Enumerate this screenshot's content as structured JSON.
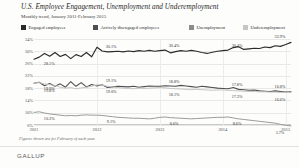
{
  "header": {
    "title": "U.S. Employee Engagement, Unemployment and Underemployment",
    "subtitle": "Monthly trend, January 2011-February 2015"
  },
  "legend": {
    "position": "top",
    "items": [
      {
        "label": "Engaged employees",
        "color": "#2b2b2b",
        "left": 0
      },
      {
        "label": "Actively disengaged employees",
        "color": "#4f4f4f",
        "left": 72
      },
      {
        "label": "Unemployment",
        "color": "#8c8c8c",
        "left": 168
      },
      {
        "label": "Underemployment",
        "color": "#c6c6c6",
        "left": 222
      }
    ]
  },
  "footnote": "Figures shown are for February of each year.",
  "brand": "GALLUP",
  "chart_data": {
    "type": "line",
    "title": "U.S. Employee Engagement, Unemployment and Underemployment",
    "subtitle": "Monthly trend, January 2011-February 2015",
    "xlabel": "",
    "ylabel": "",
    "ylim": [
      6,
      34
    ],
    "yticks": [
      "34%",
      "30%",
      "26%",
      "22%",
      "18%",
      "14%",
      "10%",
      "6%"
    ],
    "ytick_values": [
      34,
      30,
      26,
      22,
      18,
      14,
      10,
      6
    ],
    "xticks": [
      "2011",
      "2012",
      "2013",
      "2014",
      "2015"
    ],
    "grid": true,
    "x_start": "2011-01",
    "x_end": "2015-02",
    "n_points": 50,
    "annotations": [
      {
        "series": "Engaged employees",
        "index": 1,
        "value": 28.1,
        "label": "28.1%"
      },
      {
        "series": "Engaged employees",
        "index": 13,
        "value": 30.1,
        "label": "30.1%"
      },
      {
        "series": "Engaged employees",
        "index": 25,
        "value": 30.4,
        "label": "30.4%"
      },
      {
        "series": "Engaged employees",
        "index": 37,
        "value": 30.4,
        "label": "30.4%"
      },
      {
        "series": "Engaged employees",
        "index": 49,
        "value": 32.9,
        "label": "32.9%"
      },
      {
        "series": "Actively disengaged employees",
        "index": 1,
        "value": 19.9,
        "label": "19.9%"
      },
      {
        "series": "Actively disengaged employees",
        "index": 13,
        "value": 19.1,
        "label": "19.1%"
      },
      {
        "series": "Actively disengaged employees",
        "index": 25,
        "value": 18.8,
        "label": "18.8%"
      },
      {
        "series": "Actively disengaged employees",
        "index": 37,
        "value": 17.8,
        "label": "17.8%"
      },
      {
        "series": "Actively disengaged employees",
        "index": 49,
        "value": 16.8,
        "label": "16.8%"
      },
      {
        "series": "Underemployment",
        "index": 1,
        "value": 19.8,
        "label": "19.8%"
      },
      {
        "series": "Underemployment",
        "index": 13,
        "value": 19.0,
        "label": "19.0%"
      },
      {
        "series": "Underemployment",
        "index": 25,
        "value": 18.1,
        "label": "18.1%"
      },
      {
        "series": "Underemployment",
        "index": 37,
        "value": 17.3,
        "label": "17.3%"
      },
      {
        "series": "Underemployment",
        "index": 49,
        "value": 16.6,
        "label": "16.6%"
      },
      {
        "series": "Unemployment",
        "index": 1,
        "value": 10.3,
        "label": "10.3%"
      },
      {
        "series": "Unemployment",
        "index": 13,
        "value": 9.1,
        "label": "9.1%"
      },
      {
        "series": "Unemployment",
        "index": 25,
        "value": 8.6,
        "label": "8.6%"
      },
      {
        "series": "Unemployment",
        "index": 37,
        "value": 8.6,
        "label": "8.6%"
      },
      {
        "series": "Unemployment",
        "index": 49,
        "value": 5.7,
        "label": "5.7%"
      }
    ],
    "series": [
      {
        "name": "Engaged employees",
        "color": "#2b2b2b",
        "width": 1.15,
        "values": [
          27.4,
          28.1,
          29.3,
          28.4,
          29.6,
          28.3,
          29.0,
          27.6,
          28.9,
          28.3,
          29.6,
          28.2,
          31.3,
          30.1,
          29.8,
          29.9,
          30.0,
          29.8,
          30.1,
          29.9,
          30.2,
          30.0,
          30.3,
          30.0,
          30.2,
          30.4,
          29.5,
          29.9,
          30.2,
          30.0,
          30.3,
          30.0,
          29.6,
          29.3,
          29.7,
          30.0,
          30.2,
          30.4,
          31.2,
          31.5,
          30.6,
          30.8,
          31.0,
          30.9,
          31.4,
          31.2,
          31.8,
          31.6,
          32.2,
          32.9
        ]
      },
      {
        "name": "Actively disengaged employees",
        "color": "#4f4f4f",
        "width": 1.1,
        "values": [
          19.6,
          19.9,
          18.8,
          19.5,
          18.6,
          19.4,
          18.3,
          20.1,
          18.6,
          19.8,
          18.4,
          19.2,
          18.7,
          19.1,
          18.2,
          18.4,
          18.6,
          18.5,
          18.4,
          18.6,
          18.3,
          18.5,
          18.7,
          18.6,
          18.6,
          18.8,
          18.7,
          18.6,
          18.9,
          18.7,
          18.5,
          18.3,
          18.6,
          18.4,
          18.2,
          18.0,
          17.9,
          17.8,
          18.2,
          17.6,
          17.5,
          17.3,
          17.4,
          17.1,
          17.0,
          16.9,
          17.1,
          16.9,
          16.7,
          16.8
        ]
      },
      {
        "name": "Underemployment",
        "color": "#c6c6c6",
        "width": 1.0,
        "values": [
          19.6,
          19.8,
          19.4,
          19.1,
          18.9,
          18.3,
          18.0,
          18.2,
          17.8,
          18.1,
          18.3,
          18.6,
          19.1,
          19.0,
          18.6,
          18.4,
          18.2,
          18.0,
          17.9,
          17.8,
          18.0,
          17.9,
          18.0,
          18.1,
          18.2,
          18.1,
          17.9,
          17.8,
          17.7,
          17.6,
          17.5,
          17.6,
          17.5,
          17.4,
          17.3,
          17.4,
          17.4,
          17.3,
          17.2,
          17.1,
          17.0,
          16.9,
          16.9,
          16.8,
          16.8,
          16.7,
          16.7,
          16.6,
          16.6,
          16.6
        ]
      },
      {
        "name": "Unemployment",
        "color": "#9b9b9b",
        "width": 1.0,
        "values": [
          10.1,
          10.3,
          9.9,
          9.6,
          9.4,
          9.2,
          9.0,
          9.1,
          9.0,
          9.2,
          9.3,
          9.2,
          9.2,
          9.1,
          8.9,
          8.7,
          8.5,
          8.4,
          8.3,
          8.2,
          8.2,
          8.1,
          8.0,
          8.2,
          8.5,
          8.6,
          8.4,
          8.3,
          8.2,
          8.1,
          8.0,
          8.1,
          8.2,
          8.3,
          8.4,
          8.5,
          8.5,
          8.6,
          8.3,
          8.0,
          7.8,
          7.6,
          7.4,
          7.2,
          7.0,
          6.8,
          6.6,
          6.2,
          5.9,
          5.7
        ]
      }
    ]
  }
}
